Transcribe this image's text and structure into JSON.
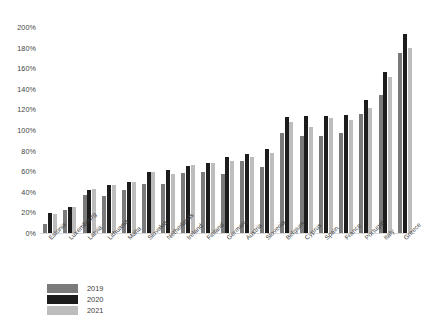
{
  "chart_data": {
    "type": "bar",
    "title": "",
    "subtitle": "",
    "xlabel": "",
    "ylabel": "",
    "ylim": [
      0,
      200
    ],
    "ytick_labels": [
      "200%",
      "180%",
      "160%",
      "140%",
      "120%",
      "100%",
      "80%",
      "60%",
      "40%",
      "20%",
      "0%"
    ],
    "ytick_values": [
      200,
      180,
      160,
      140,
      120,
      100,
      80,
      60,
      40,
      20,
      0
    ],
    "grid": false,
    "legend_position": "bottom-left",
    "categories": [
      "Estonia",
      "Luxembourg",
      "Latvia",
      "Lithuania",
      "Malta",
      "Slovakia",
      "Netherlands",
      "Ireland",
      "Finland",
      "Germany",
      "Austria",
      "Slovenia",
      "Belgium",
      "Cyprus",
      "Spain",
      "France",
      "Portugal",
      "Italy",
      "Greece"
    ],
    "series": [
      {
        "name": "2019",
        "color": "#7a7a7a",
        "values": [
          9,
          22,
          37,
          36,
          42,
          48,
          48,
          58,
          59,
          57,
          70,
          64,
          97,
          94,
          94,
          97,
          116,
          134,
          175
        ]
      },
      {
        "name": "2020",
        "color": "#1c1c1c",
        "values": [
          19,
          25,
          42,
          47,
          50,
          59,
          61,
          65,
          68,
          74,
          77,
          82,
          113,
          114,
          114,
          115,
          129,
          156,
          193
        ]
      },
      {
        "name": "2021",
        "color": "#bdbdbd",
        "values": [
          18,
          25,
          43,
          47,
          50,
          59,
          57,
          66,
          68,
          70,
          74,
          78,
          108,
          103,
          112,
          110,
          121,
          151,
          180
        ]
      }
    ]
  },
  "legend": {
    "items": [
      {
        "label": "2019",
        "color": "#7a7a7a"
      },
      {
        "label": "2020",
        "color": "#1c1c1c"
      },
      {
        "label": "2021",
        "color": "#bdbdbd"
      }
    ]
  }
}
